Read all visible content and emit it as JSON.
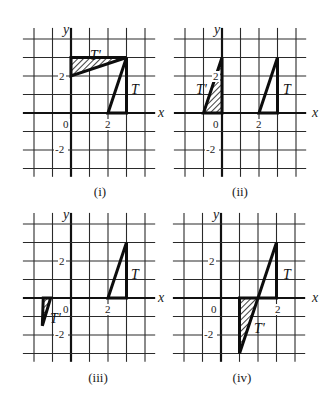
{
  "figure": {
    "unit_px": 18.5,
    "grid": {
      "x_lines": [
        -2,
        -1,
        0,
        1,
        2,
        3,
        4
      ],
      "y_lines": [
        4,
        3,
        2,
        1,
        0,
        -1,
        -2,
        -3
      ],
      "x_extent": [
        -2.6,
        4.55
      ],
      "y_extent": [
        4.6,
        -3.45
      ]
    },
    "colors": {
      "ink": "#111111",
      "grid": "#2a2a2a",
      "background": "#ffffff"
    },
    "panels": [
      {
        "id": "i",
        "caption": "(i)",
        "origin_px": [
          71,
          113
        ],
        "caption_px": [
          100,
          196
        ],
        "axis_labels": {
          "x": "x",
          "y": "y"
        },
        "x_axis_label_px": [
          158,
          117
        ],
        "y_axis_label_px": [
          63,
          34
        ],
        "tick_labels": [
          {
            "text": "0",
            "px": [
              63,
              128
            ],
            "axis": "origin"
          },
          {
            "text": "2",
            "px": [
              105,
              128
            ],
            "axis": "x"
          },
          {
            "text": "2",
            "px": [
              59,
              80
            ],
            "axis": "y"
          },
          {
            "text": "-2",
            "px": [
              55,
              153
            ],
            "axis": "y"
          }
        ],
        "T": {
          "label": "T",
          "vertices": [
            [
              2,
              0
            ],
            [
              3,
              0
            ],
            [
              3,
              3
            ]
          ],
          "label_px": [
            131,
            89
          ]
        },
        "T_prime": {
          "label": "T'",
          "vertices": [
            [
              0,
              3
            ],
            [
              3,
              3
            ],
            [
              0,
              2
            ]
          ],
          "shaded": true,
          "label_px": [
            90,
            55
          ]
        }
      },
      {
        "id": "ii",
        "caption": "(ii)",
        "origin_px": [
          222,
          113
        ],
        "caption_px": [
          240,
          196
        ],
        "axis_labels": {
          "x": "x",
          "y": "y"
        },
        "x_axis_label_px": [
          312,
          117
        ],
        "y_axis_label_px": [
          214,
          34
        ],
        "tick_labels": [
          {
            "text": "0",
            "px": [
              213,
              128
            ],
            "axis": "origin"
          },
          {
            "text": "2",
            "px": [
              256,
              128
            ],
            "axis": "x"
          },
          {
            "text": "2",
            "px": [
              213,
              80
            ],
            "axis": "y"
          },
          {
            "text": "-2",
            "px": [
              206,
              153
            ],
            "axis": "y"
          }
        ],
        "T": {
          "label": "T",
          "vertices": [
            [
              2,
              0
            ],
            [
              3,
              0
            ],
            [
              3,
              3
            ]
          ],
          "label_px": [
            283,
            89
          ]
        },
        "T_prime": {
          "label": "T'",
          "vertices": [
            [
              -1,
              0
            ],
            [
              0,
              0
            ],
            [
              0,
              3
            ]
          ],
          "shaded": true,
          "label_px": [
            196,
            89
          ]
        }
      },
      {
        "id": "iii",
        "caption": "(iii)",
        "origin_px": [
          71,
          298
        ],
        "caption_px": [
          98,
          382
        ],
        "axis_labels": {
          "x": "x",
          "y": "y"
        },
        "x_axis_label_px": [
          158,
          302
        ],
        "y_axis_label_px": [
          63,
          219
        ],
        "tick_labels": [
          {
            "text": "0",
            "px": [
              63,
              313
            ],
            "axis": "origin"
          },
          {
            "text": "2",
            "px": [
              105,
              313
            ],
            "axis": "x"
          },
          {
            "text": "2",
            "px": [
              59,
              265
            ],
            "axis": "y"
          },
          {
            "text": "-2",
            "px": [
              55,
              338
            ],
            "axis": "y"
          }
        ],
        "T": {
          "label": "T",
          "vertices": [
            [
              2,
              0
            ],
            [
              3,
              0
            ],
            [
              3,
              3
            ]
          ],
          "label_px": [
            131,
            274
          ]
        },
        "T_prime": {
          "label": "T'",
          "vertices": [
            [
              -1.5,
              0
            ],
            [
              -1.1,
              0
            ],
            [
              -1.55,
              -1.5
            ]
          ],
          "shaded": true,
          "label_px": [
            50,
            318
          ]
        }
      },
      {
        "id": "iv",
        "caption": "(iv)",
        "origin_px": [
          221,
          298
        ],
        "caption_px": [
          242,
          382
        ],
        "axis_labels": {
          "x": "x",
          "y": "y"
        },
        "x_axis_label_px": [
          312,
          302
        ],
        "y_axis_label_px": [
          213,
          219
        ],
        "tick_labels": [
          {
            "text": "0",
            "px": [
              211,
              313
            ],
            "axis": "origin"
          },
          {
            "text": "2",
            "px": [
              275,
              313
            ],
            "axis": "x"
          },
          {
            "text": "2",
            "px": [
              209,
              265
            ],
            "axis": "y"
          },
          {
            "text": "-2",
            "px": [
              204,
              338
            ],
            "axis": "y"
          }
        ],
        "T": {
          "label": "T",
          "vertices": [
            [
              2,
              0
            ],
            [
              3,
              0
            ],
            [
              3,
              3
            ]
          ],
          "label_px": [
            283,
            274
          ]
        },
        "T_prime": {
          "label": "T'",
          "vertices": [
            [
              1,
              0
            ],
            [
              2,
              0
            ],
            [
              1,
              -3
            ]
          ],
          "shaded": true,
          "label_px": [
            254,
            328
          ]
        }
      }
    ]
  }
}
